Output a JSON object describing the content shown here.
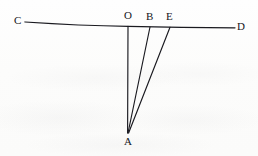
{
  "figure": {
    "kind": "geometry-diagram",
    "stroke_color": "#1a1a20",
    "background_color": "#fdfdfc",
    "labels": [
      {
        "id": "C",
        "text": "C",
        "x": 14,
        "y": 15
      },
      {
        "id": "O",
        "text": "O",
        "x": 124,
        "y": 10
      },
      {
        "id": "B",
        "text": "B",
        "x": 146,
        "y": 11
      },
      {
        "id": "E",
        "text": "E",
        "x": 166,
        "y": 11
      },
      {
        "id": "D",
        "text": "D",
        "x": 237,
        "y": 21
      },
      {
        "id": "A",
        "text": "A",
        "x": 124,
        "y": 136
      }
    ],
    "points": {
      "C": {
        "x": 25,
        "y": 22
      },
      "O": {
        "x": 128,
        "y": 26
      },
      "B": {
        "x": 150,
        "y": 27
      },
      "E": {
        "x": 170,
        "y": 27
      },
      "D": {
        "x": 235,
        "y": 28
      },
      "A": {
        "x": 128,
        "y": 133
      }
    },
    "segments": [
      {
        "id": "CD",
        "from": "C",
        "to": "D",
        "name": "line-cd"
      },
      {
        "id": "OA",
        "from": "O",
        "to": "A",
        "name": "segment-oa"
      },
      {
        "id": "BA",
        "from": "B",
        "to": "A",
        "name": "segment-ba"
      },
      {
        "id": "EA",
        "from": "E",
        "to": "A",
        "name": "segment-ea"
      }
    ]
  }
}
